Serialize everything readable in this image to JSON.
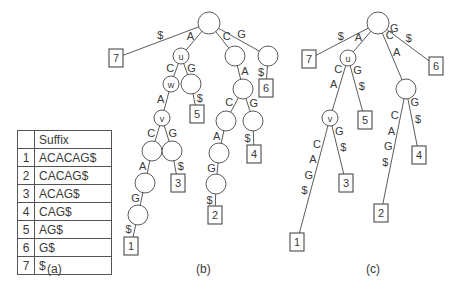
{
  "table": {
    "header": [
      "",
      "Suffix"
    ],
    "rows": [
      {
        "index": "1",
        "suffix": "ACACAG$"
      },
      {
        "index": "2",
        "suffix": "CACAG$"
      },
      {
        "index": "3",
        "suffix": "ACAG$"
      },
      {
        "index": "4",
        "suffix": "CAG$"
      },
      {
        "index": "5",
        "suffix": "AG$"
      },
      {
        "index": "6",
        "suffix": "G$"
      },
      {
        "index": "7",
        "suffix": "$"
      }
    ]
  },
  "captions": {
    "a": "(a)",
    "b": "(b)",
    "c": "(c)"
  },
  "trees": {
    "b": {
      "title": "suffix trie",
      "nodes": [
        {
          "id": "b_root",
          "type": "internal",
          "label": ""
        },
        {
          "id": "b_u",
          "type": "internal",
          "label": "u"
        },
        {
          "id": "b_w",
          "type": "internal",
          "label": "w"
        },
        {
          "id": "b_ag",
          "type": "internal",
          "label": ""
        },
        {
          "id": "b_v",
          "type": "internal",
          "label": "v"
        },
        {
          "id": "b_vc",
          "type": "internal",
          "label": ""
        },
        {
          "id": "b_vg",
          "type": "internal",
          "label": ""
        },
        {
          "id": "b_vca",
          "type": "internal",
          "label": ""
        },
        {
          "id": "b_vcag",
          "type": "internal",
          "label": ""
        },
        {
          "id": "b_c",
          "type": "internal",
          "label": ""
        },
        {
          "id": "b_ca",
          "type": "internal",
          "label": ""
        },
        {
          "id": "b_cac",
          "type": "internal",
          "label": ""
        },
        {
          "id": "b_cag",
          "type": "internal",
          "label": ""
        },
        {
          "id": "b_caca",
          "type": "internal",
          "label": ""
        },
        {
          "id": "b_cacag",
          "type": "internal",
          "label": ""
        },
        {
          "id": "b_g",
          "type": "internal",
          "label": ""
        },
        {
          "id": "b_l7",
          "type": "leaf",
          "label": "7"
        },
        {
          "id": "b_l5",
          "type": "leaf",
          "label": "5"
        },
        {
          "id": "b_l3",
          "type": "leaf",
          "label": "3"
        },
        {
          "id": "b_l1",
          "type": "leaf",
          "label": "1"
        },
        {
          "id": "b_l4",
          "type": "leaf",
          "label": "4"
        },
        {
          "id": "b_l2",
          "type": "leaf",
          "label": "2"
        },
        {
          "id": "b_l6",
          "type": "leaf",
          "label": "6"
        }
      ],
      "edges": [
        {
          "from": "b_root",
          "to": "b_l7",
          "label": "$"
        },
        {
          "from": "b_root",
          "to": "b_u",
          "label": "A"
        },
        {
          "from": "b_root",
          "to": "b_c",
          "label": "C"
        },
        {
          "from": "b_root",
          "to": "b_g",
          "label": "G"
        },
        {
          "from": "b_u",
          "to": "b_w",
          "label": "C"
        },
        {
          "from": "b_u",
          "to": "b_ag",
          "label": "G"
        },
        {
          "from": "b_ag",
          "to": "b_l5",
          "label": "$"
        },
        {
          "from": "b_w",
          "to": "b_v",
          "label": "A"
        },
        {
          "from": "b_v",
          "to": "b_vc",
          "label": "C"
        },
        {
          "from": "b_v",
          "to": "b_vg",
          "label": "G"
        },
        {
          "from": "b_vg",
          "to": "b_l3",
          "label": "$"
        },
        {
          "from": "b_vc",
          "to": "b_vca",
          "label": "A"
        },
        {
          "from": "b_vca",
          "to": "b_vcag",
          "label": "G"
        },
        {
          "from": "b_vcag",
          "to": "b_l1",
          "label": "$"
        },
        {
          "from": "b_c",
          "to": "b_ca",
          "label": "A"
        },
        {
          "from": "b_ca",
          "to": "b_cac",
          "label": "C"
        },
        {
          "from": "b_ca",
          "to": "b_cag",
          "label": "G"
        },
        {
          "from": "b_cag",
          "to": "b_l4",
          "label": "$"
        },
        {
          "from": "b_cac",
          "to": "b_caca",
          "label": "A"
        },
        {
          "from": "b_caca",
          "to": "b_cacag",
          "label": "G"
        },
        {
          "from": "b_cacag",
          "to": "b_l2",
          "label": "$"
        },
        {
          "from": "b_g",
          "to": "b_l6",
          "label": "$"
        }
      ]
    },
    "c": {
      "title": "suffix tree",
      "nodes": [
        {
          "id": "c_root",
          "type": "internal",
          "label": ""
        },
        {
          "id": "c_u",
          "type": "internal",
          "label": "u"
        },
        {
          "id": "c_v",
          "type": "internal",
          "label": "v"
        },
        {
          "id": "c_ca",
          "type": "internal",
          "label": ""
        },
        {
          "id": "c_l7",
          "type": "leaf",
          "label": "7"
        },
        {
          "id": "c_l6",
          "type": "leaf",
          "label": "6"
        },
        {
          "id": "c_l5",
          "type": "leaf",
          "label": "5"
        },
        {
          "id": "c_l3",
          "type": "leaf",
          "label": "3"
        },
        {
          "id": "c_l1",
          "type": "leaf",
          "label": "1"
        },
        {
          "id": "c_l2",
          "type": "leaf",
          "label": "2"
        },
        {
          "id": "c_l4",
          "type": "leaf",
          "label": "4"
        }
      ],
      "edges": [
        {
          "from": "c_root",
          "to": "c_l7",
          "label": "$"
        },
        {
          "from": "c_root",
          "to": "c_u",
          "label": "A"
        },
        {
          "from": "c_root",
          "to": "c_ca",
          "label": "CA"
        },
        {
          "from": "c_root",
          "to": "c_l6",
          "label": "G$"
        },
        {
          "from": "c_u",
          "to": "c_v",
          "label": "CA"
        },
        {
          "from": "c_u",
          "to": "c_l5",
          "label": "G$"
        },
        {
          "from": "c_v",
          "to": "c_l1",
          "label": "CAG$"
        },
        {
          "from": "c_v",
          "to": "c_l3",
          "label": "G$"
        },
        {
          "from": "c_ca",
          "to": "c_l2",
          "label": "CAG$"
        },
        {
          "from": "c_ca",
          "to": "c_l4",
          "label": "G$"
        }
      ]
    }
  }
}
